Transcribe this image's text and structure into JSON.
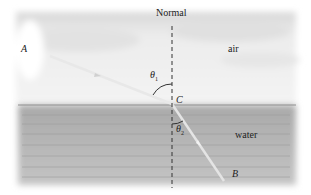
{
  "diagram": {
    "labels": {
      "normal": "Normal",
      "point_a": "A",
      "point_b": "B",
      "point_c": "C",
      "theta1": "θ",
      "theta1_sub": "1",
      "theta2": "θ",
      "theta2_sub": "2",
      "air": "air",
      "water": "water"
    },
    "colors": {
      "sky": "#f1f1f1",
      "water": "#bdbdbd",
      "ray": "#e6e6e6",
      "normal_line": "#333333"
    }
  }
}
